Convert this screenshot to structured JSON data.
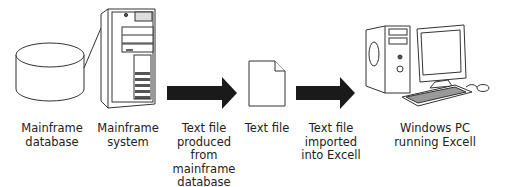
{
  "diagram": {
    "nodes": [
      {
        "id": "mainframe-database",
        "icon": "database-cylinder-icon",
        "label": [
          "Mainframe",
          "database"
        ]
      },
      {
        "id": "mainframe-system",
        "icon": "mainframe-tower-icon",
        "label": [
          "Mainframe",
          "system"
        ]
      },
      {
        "id": "text-file-produced",
        "icon": "right-arrow-icon",
        "label": [
          "Text file",
          "produced",
          "from",
          "mainframe",
          "database"
        ]
      },
      {
        "id": "text-file",
        "icon": "document-icon",
        "label": [
          "Text file"
        ]
      },
      {
        "id": "text-file-imported",
        "icon": "right-arrow-icon",
        "label": [
          "Text file",
          "imported",
          "into Excell"
        ]
      },
      {
        "id": "windows-pc",
        "icon": "desktop-computer-icon",
        "label": [
          "Windows PC",
          "running Excell"
        ]
      }
    ],
    "colors": {
      "stroke": "#333333",
      "arrow": "#1a1a1a",
      "fill": "#ffffff",
      "background": "#ffffff"
    }
  }
}
